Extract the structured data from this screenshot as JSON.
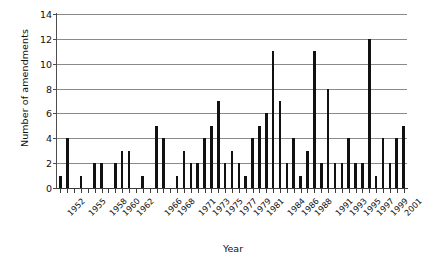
{
  "chart_data": {
    "type": "bar",
    "title": "",
    "xlabel": "Year",
    "ylabel": "Number of amendments",
    "ylim": [
      0,
      14
    ],
    "ytick_values": [
      0,
      2,
      4,
      6,
      8,
      10,
      12,
      14
    ],
    "ytick_labels": [
      "0",
      "2",
      "4",
      "6",
      "8",
      "10",
      "12",
      "14"
    ],
    "grid": true,
    "legend": false,
    "legend_position": "none",
    "bar_color": "#111111",
    "gridline_color": "#8a8a8a",
    "axis_color": "#3a3a3a",
    "categories": [
      "1952",
      "1953",
      "1954",
      "1955",
      "1956",
      "1957",
      "1958",
      "1959",
      "1960",
      "1961",
      "1962",
      "1963",
      "1964",
      "1965",
      "1966",
      "1967",
      "1968",
      "1969",
      "1970",
      "1971",
      "1972",
      "1973",
      "1974",
      "1975",
      "1976",
      "1977",
      "1978",
      "1979",
      "1980",
      "1981",
      "1982",
      "1983",
      "1984",
      "1985",
      "1986",
      "1987",
      "1988",
      "1989",
      "1990",
      "1991",
      "1992",
      "1993",
      "1994",
      "1995",
      "1996",
      "1997",
      "1998",
      "1999",
      "2000",
      "2001",
      "2002"
    ],
    "values": [
      1,
      4,
      0,
      1,
      0,
      2,
      2,
      0,
      2,
      3,
      3,
      0,
      1,
      0,
      5,
      4,
      0,
      1,
      3,
      2,
      2,
      4,
      5,
      7,
      2,
      3,
      2,
      1,
      4,
      5,
      6,
      11,
      7,
      2,
      4,
      1,
      3,
      11,
      2,
      8,
      2,
      2,
      4,
      2,
      2,
      12,
      1,
      4,
      2,
      4,
      5
    ],
    "xtick_labels_shown": [
      "1952",
      "1955",
      "1958",
      "1960",
      "1962",
      "1966",
      "1968",
      "1971",
      "1973",
      "1975",
      "1977",
      "1979",
      "1981",
      "1984",
      "1986",
      "1988",
      "1991",
      "1993",
      "1995",
      "1997",
      "1999",
      "2001"
    ]
  }
}
